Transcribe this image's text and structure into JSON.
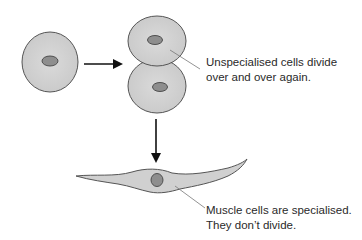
{
  "diagram": {
    "colors": {
      "cell_fill": "#d0d0d0",
      "cell_stroke": "#555555",
      "nucleus_fill": "#8e8e8e",
      "arrow": "#111111",
      "leader_line": "#777777",
      "text": "#2a2a2a"
    },
    "nodes": [
      {
        "id": "unspecialised-cell",
        "type": "round-cell"
      },
      {
        "id": "dividing-cell-top",
        "type": "round-cell"
      },
      {
        "id": "dividing-cell-bottom",
        "type": "round-cell"
      },
      {
        "id": "muscle-cell",
        "type": "spindle-cell"
      }
    ],
    "edges": [
      {
        "from": "unspecialised-cell",
        "to": "dividing-cells",
        "direction": "right"
      },
      {
        "from": "dividing-cells",
        "to": "muscle-cell",
        "direction": "down"
      }
    ],
    "annotations": {
      "dividing": {
        "line1": "Unspecialised cells divide",
        "line2": "over and over again."
      },
      "muscle": {
        "line1": "Muscle cells are specialised.",
        "line2": "They don’t divide."
      }
    }
  }
}
